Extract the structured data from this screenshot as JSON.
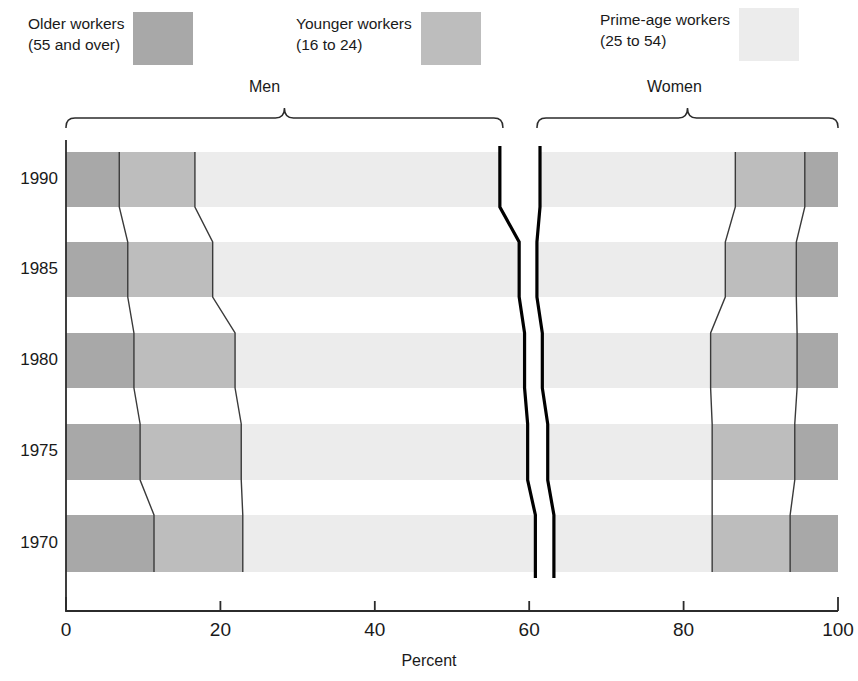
{
  "legend": {
    "items": [
      {
        "name": "older-workers",
        "line1": "Older workers",
        "line2": "(55 and over)",
        "color": "#a8a8a8"
      },
      {
        "name": "younger-workers",
        "line1": "Younger workers",
        "line2": "(16 to 24)",
        "color": "#bdbdbd"
      },
      {
        "name": "prime-age-workers",
        "line1": "Prime-age workers",
        "line2": "(25 to 54)",
        "color": "#ececec"
      }
    ]
  },
  "groups": {
    "men_label": "Men",
    "women_label": "Women"
  },
  "axis": {
    "title": "Percent",
    "ticks": [
      "0",
      "20",
      "40",
      "60",
      "80",
      "100"
    ],
    "tick_values": [
      0,
      20,
      40,
      60,
      80,
      100
    ]
  },
  "years": [
    "1990",
    "1985",
    "1980",
    "1975",
    "1970"
  ],
  "chart_data": {
    "type": "bar",
    "subtype": "stacked-horizontal-100pct",
    "title": "",
    "xlabel": "Percent",
    "ylabel": "",
    "xlim": [
      0,
      100
    ],
    "grid": false,
    "legend_position": "top",
    "categories": [
      "1990",
      "1985",
      "1980",
      "1975",
      "1970"
    ],
    "groups": [
      "Men",
      "Women"
    ],
    "series": [
      {
        "name": "Older workers (55 and over)",
        "color": "#a8a8a8"
      },
      {
        "name": "Younger workers (16 to 24)",
        "color": "#bdbdbd"
      },
      {
        "name": "Prime-age workers (25 to 54)",
        "color": "#ececec"
      }
    ],
    "note": "Each row is a single 0-100 percent axis. The Men block runs left-to-right from 0; the Women block is right-aligned ending at 100. A white gap separated by two heavy black lines divides the two blocks.",
    "rows": [
      {
        "year": "1990",
        "men": {
          "older_end": 6.9,
          "younger_end": 16.7,
          "prime_end": 56.2,
          "older": 6.9,
          "younger": 9.8,
          "prime": 39.5,
          "total": 56.2
        },
        "women": {
          "prime_start": 61.4,
          "younger_start": 86.7,
          "older_start": 95.7,
          "prime": 25.3,
          "younger": 9.0,
          "older": 4.3,
          "total": 38.6
        }
      },
      {
        "year": "1985",
        "men": {
          "older_end": 8.0,
          "younger_end": 19.0,
          "prime_end": 58.7,
          "older": 8.0,
          "younger": 11.0,
          "prime": 39.7,
          "total": 58.7
        },
        "women": {
          "prime_start": 61.0,
          "younger_start": 85.4,
          "older_start": 94.6,
          "prime": 24.4,
          "younger": 9.2,
          "older": 5.4,
          "total": 39.0
        }
      },
      {
        "year": "1980",
        "men": {
          "older_end": 8.8,
          "younger_end": 21.9,
          "prime_end": 59.4,
          "older": 8.8,
          "younger": 13.1,
          "prime": 37.5,
          "total": 59.4
        },
        "women": {
          "prime_start": 61.7,
          "younger_start": 83.5,
          "older_start": 94.7,
          "prime": 21.8,
          "younger": 11.2,
          "older": 5.3,
          "total": 38.3
        }
      },
      {
        "year": "1975",
        "men": {
          "older_end": 9.6,
          "younger_end": 22.7,
          "prime_end": 59.8,
          "older": 9.6,
          "younger": 13.1,
          "prime": 37.1,
          "total": 59.8
        },
        "women": {
          "prime_start": 62.4,
          "younger_start": 83.7,
          "older_start": 94.4,
          "prime": 21.3,
          "younger": 10.7,
          "older": 5.6,
          "total": 37.6
        }
      },
      {
        "year": "1970",
        "men": {
          "older_end": 11.4,
          "younger_end": 22.9,
          "prime_end": 60.8,
          "older": 11.4,
          "younger": 11.5,
          "prime": 37.9,
          "total": 60.8
        },
        "women": {
          "prime_start": 63.2,
          "younger_start": 83.7,
          "older_start": 93.8,
          "prime": 20.5,
          "younger": 10.1,
          "older": 6.2,
          "total": 36.8
        }
      }
    ]
  }
}
